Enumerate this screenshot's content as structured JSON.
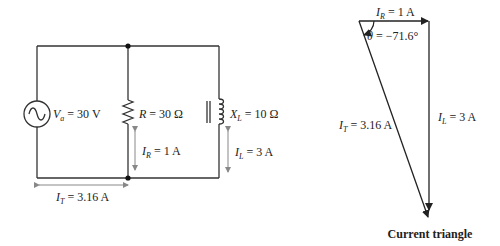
{
  "circuit": {
    "source": {
      "symbol": "V",
      "subscript": "a",
      "value": " = 30 V"
    },
    "resistor": {
      "symbol": "R",
      "value": " = 30 Ω"
    },
    "inductor": {
      "symbol": "X",
      "subscript": "L",
      "value": " = 10 Ω"
    },
    "resistor_current": {
      "symbol": "I",
      "subscript": "R",
      "value": " = 1 A"
    },
    "inductor_current": {
      "symbol": "I",
      "subscript": "L",
      "value": " = 3 A"
    },
    "total_current": {
      "symbol": "I",
      "subscript": "T",
      "value": " = 3.16 A"
    }
  },
  "triangle": {
    "top": {
      "symbol": "I",
      "subscript": "R",
      "value": " = 1 A"
    },
    "angle": {
      "symbol": "θ",
      "value": " = −71.6°"
    },
    "right": {
      "symbol": "I",
      "subscript": "L",
      "value": " = 3 A"
    },
    "hypotenuse": {
      "symbol": "I",
      "subscript": "T",
      "value": " = 3.16 A"
    },
    "title": "Current triangle"
  },
  "colors": {
    "wire": "#333333",
    "arrow": "#888888",
    "text": "#222222"
  }
}
